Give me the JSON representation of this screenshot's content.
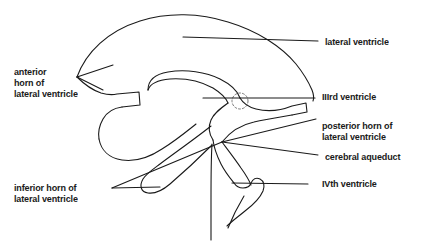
{
  "figure": {
    "background_color": "#ffffff",
    "ink_color": "#1a1a1a",
    "stroke_width": 1.1
  },
  "labels": {
    "lateral_ventricle": {
      "name": "lateral ventricle",
      "lines": [
        "lateral ventricle"
      ],
      "x": 325,
      "y": 36
    },
    "anterior_horn": {
      "name": "anterior horn of lateral ventricle",
      "lines": [
        "anterior",
        "horn of",
        "lateral ventricle"
      ],
      "x": 14,
      "y": 66
    },
    "third_ventricle": {
      "name": "IIIrd ventricle",
      "lines": [
        "IIIrd ventricle"
      ],
      "x": 322,
      "y": 91
    },
    "posterior_horn": {
      "name": "posterior horn of lateral ventricle",
      "lines": [
        "posterior horn of",
        "lateral ventricle"
      ],
      "x": 322,
      "y": 120
    },
    "cerebral_aqueduct": {
      "name": "cerebral aqueduct",
      "lines": [
        "cerebral aqueduct"
      ],
      "x": 325,
      "y": 151
    },
    "fourth_ventricle": {
      "name": "IVth ventricle",
      "lines": [
        "IVth ventricle"
      ],
      "x": 322,
      "y": 178
    },
    "inferior_horn": {
      "name": "inferior horn of lateral ventricle",
      "lines": [
        "inferior horn of",
        "lateral ventricle"
      ],
      "x": 14,
      "y": 182
    }
  },
  "leader_lines": {
    "lateral_ventricle": {
      "x1": 183,
      "y1": 37,
      "x2": 318,
      "y2": 41
    },
    "anterior_horn": {
      "x1": 113,
      "y1": 65,
      "x2": 77,
      "y2": 77
    },
    "anterior_horn_b": {
      "x1": 103,
      "y1": 90,
      "x2": 77,
      "y2": 77
    },
    "third_ventricle": {
      "x1": 203,
      "y1": 98,
      "x2": 315,
      "y2": 98
    },
    "posterior_horn": {
      "x1": 222,
      "y1": 142,
      "x2": 316,
      "y2": 119
    },
    "cerebral_aqueduct": {
      "x1": 222,
      "y1": 142,
      "x2": 318,
      "y2": 155
    },
    "inferior_horn": {
      "x1": 222,
      "y1": 142,
      "x2": 112,
      "y2": 188
    },
    "inferior_horn_b": {
      "x1": 160,
      "y1": 187,
      "x2": 112,
      "y2": 188
    },
    "fourth_ventricle": {
      "x1": 232,
      "y1": 183,
      "x2": 308,
      "y2": 184
    }
  },
  "anatomy_parts": [
    "lateral-ventricle-outline",
    "corpus-callosum-arc",
    "third-ventricle-body",
    "interventricular-foramen",
    "inferior-horn",
    "cerebral-aqueduct-channel",
    "fourth-ventricle",
    "central-canal"
  ]
}
